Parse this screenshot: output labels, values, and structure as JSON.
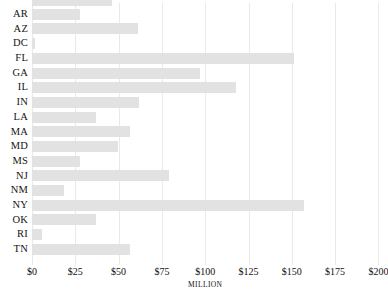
{
  "chart_data": {
    "type": "bar",
    "orientation": "horizontal",
    "title": "",
    "xlabel": "MILLION",
    "ylabel": "",
    "xlim": [
      0,
      200
    ],
    "grid": true,
    "legend": null,
    "bar_color": "#e2e2e2",
    "x_tick_labels": [
      "$0",
      "$25",
      "$50",
      "$75",
      "$100",
      "$125",
      "$150",
      "$175",
      "$200"
    ],
    "x_tick_values": [
      0,
      25,
      50,
      75,
      100,
      125,
      150,
      175,
      200
    ],
    "categories": [
      "AR",
      "AZ",
      "DC",
      "FL",
      "GA",
      "IL",
      "IN",
      "LA",
      "MA",
      "MD",
      "MS",
      "NJ",
      "NM",
      "NY",
      "OK",
      "RI",
      "TN"
    ],
    "values": [
      27.5,
      61,
      1.5,
      151,
      97,
      118,
      62,
      37,
      56.5,
      49.5,
      28,
      79,
      18.5,
      157,
      37,
      6,
      56.5
    ],
    "clipped_top_row": {
      "label": "",
      "value": 46
    }
  },
  "axis": {
    "unit_label": "MILLION"
  }
}
